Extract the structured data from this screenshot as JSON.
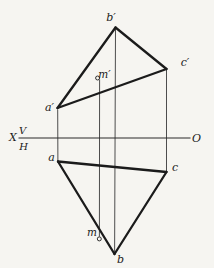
{
  "figure": {
    "canvas": {
      "width": 214,
      "height": 268,
      "background": "#f6f5f1",
      "ink": "#1b1b1b",
      "thin_color": "#4d4d4d",
      "axis_color": "#2a2a2a"
    },
    "axis": {
      "y": 138,
      "x_start": 18.5,
      "x_end": 190.5
    },
    "edges": [
      {
        "id": "a-prime--b-prime",
        "x1": 57.5,
        "y1": 108,
        "x2": 115.5,
        "y2": 27.5
      },
      {
        "id": "b-prime--c-prime",
        "x1": 115.5,
        "y1": 27.5,
        "x2": 166.5,
        "y2": 69
      },
      {
        "id": "a-prime--c-prime",
        "x1": 57.5,
        "y1": 108,
        "x2": 166.5,
        "y2": 69
      },
      {
        "id": "a--b",
        "x1": 58,
        "y1": 161.5,
        "x2": 114.5,
        "y2": 254
      },
      {
        "id": "b--c",
        "x1": 114.5,
        "y1": 254,
        "x2": 166.5,
        "y2": 172
      },
      {
        "id": "a--c",
        "x1": 58,
        "y1": 161.5,
        "x2": 166.5,
        "y2": 172
      }
    ],
    "projection_lines": [
      {
        "id": "through-a",
        "x1": 57.7,
        "y1": 109.5,
        "x2": 57.9,
        "y2": 161
      },
      {
        "id": "through-m",
        "x1": 99.6,
        "y1": 79.5,
        "x2": 99.4,
        "y2": 236.6
      },
      {
        "id": "through-b",
        "x1": 115.5,
        "y1": 28.5,
        "x2": 114.6,
        "y2": 253.5
      },
      {
        "id": "through-c",
        "x1": 166.5,
        "y1": 70,
        "x2": 166.5,
        "y2": 171.5
      }
    ],
    "marked_points": [
      {
        "id": "m-prime",
        "x": 97.6,
        "y": 78,
        "r": 2
      },
      {
        "id": "m",
        "x": 99.3,
        "y": 238.9,
        "r": 2
      }
    ],
    "labels": [
      {
        "id": "b-prime",
        "text": "b′",
        "x": 111,
        "y": 17.5,
        "size": 11
      },
      {
        "id": "c-prime",
        "text": "c′",
        "x": 185,
        "y": 62.5,
        "size": 11
      },
      {
        "id": "m-prime",
        "text": "m′",
        "x": 104.5,
        "y": 74,
        "size": 10.5
      },
      {
        "id": "a-prime",
        "text": "a′",
        "x": 49.5,
        "y": 107.5,
        "size": 11
      },
      {
        "id": "a",
        "text": "a",
        "x": 51.5,
        "y": 157.5,
        "size": 11
      },
      {
        "id": "c",
        "text": "c",
        "x": 175,
        "y": 167.5,
        "size": 11
      },
      {
        "id": "m",
        "text": "m",
        "x": 92,
        "y": 231.5,
        "size": 10.5
      },
      {
        "id": "b",
        "text": "b",
        "x": 120.5,
        "y": 259.5,
        "size": 11
      },
      {
        "id": "axis-x",
        "text": "X",
        "x": 13,
        "y": 137.5,
        "size": 11
      },
      {
        "id": "axis-v",
        "text": "V",
        "x": 22.5,
        "y": 130.5,
        "size": 10
      },
      {
        "id": "axis-h",
        "text": "H",
        "x": 23.5,
        "y": 146,
        "size": 10
      },
      {
        "id": "axis-o",
        "text": "O",
        "x": 196.5,
        "y": 138,
        "size": 11
      }
    ]
  }
}
